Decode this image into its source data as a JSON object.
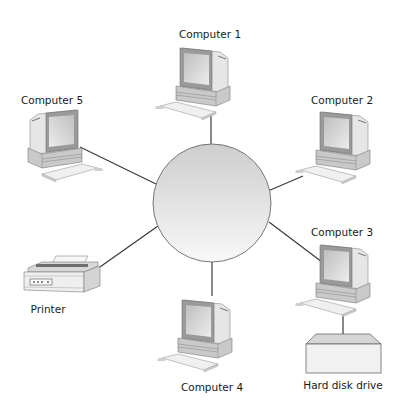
{
  "diagram": {
    "type": "star-network",
    "hub": {
      "name": "hub",
      "label": ""
    },
    "nodes": [
      {
        "id": "computer-1",
        "label": "Computer 1"
      },
      {
        "id": "computer-2",
        "label": "Computer 2"
      },
      {
        "id": "computer-3",
        "label": "Computer 3"
      },
      {
        "id": "computer-4",
        "label": "Computer 4"
      },
      {
        "id": "computer-5",
        "label": "Computer 5"
      },
      {
        "id": "printer",
        "label": "Printer"
      },
      {
        "id": "hard-disk-drive",
        "label": "Hard disk drive"
      }
    ],
    "edges": [
      {
        "from": "hub",
        "to": "computer-1"
      },
      {
        "from": "hub",
        "to": "computer-2"
      },
      {
        "from": "hub",
        "to": "computer-3"
      },
      {
        "from": "hub",
        "to": "computer-4"
      },
      {
        "from": "hub",
        "to": "computer-5"
      },
      {
        "from": "hub",
        "to": "printer"
      },
      {
        "from": "computer-3",
        "to": "hard-disk-drive"
      }
    ],
    "colors": {
      "line": "#3a3a3a",
      "hub_fill_top": "#cfcfcf",
      "hub_fill_bottom": "#f7f7f7",
      "device_shade": "#bdbdbd",
      "screen": "#d9d9d9"
    }
  }
}
